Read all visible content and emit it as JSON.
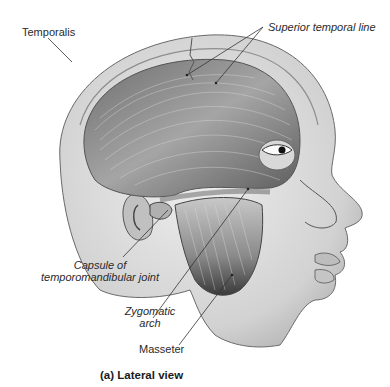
{
  "figure": {
    "caption": "(a) Lateral view",
    "labels": {
      "temporalis": "Temporalis",
      "superior_temporal_line": "Superior temporal line",
      "capsule_line1": "Capsule of",
      "capsule_line2": "temporomandibular joint",
      "zygomatic_line1": "Zygomatic",
      "zygomatic_line2": "arch",
      "masseter": "Masseter"
    }
  },
  "colors": {
    "background": "#ffffff",
    "skin": "#dcdcdc",
    "skin_shadow": "#b8b8b8",
    "muscle": "#9a9a9a",
    "muscle_dark": "#555555",
    "outline": "#6a6a6a",
    "leader_line": "#333333"
  }
}
